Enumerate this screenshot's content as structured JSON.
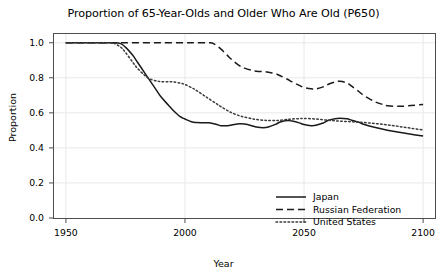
{
  "chart_data": {
    "type": "line",
    "title": "Proportion of 65-Year-Olds and Older Who Are Old (P650)",
    "xlabel": "Year",
    "ylabel": "Proportion",
    "xlim": [
      1945,
      2105
    ],
    "ylim": [
      0.0,
      1.05
    ],
    "xticks": [
      1950,
      2000,
      2050,
      2100
    ],
    "xtick_labels": [
      "1950",
      "2000",
      "2050",
      "2100"
    ],
    "yticks": [
      0.0,
      0.2,
      0.4,
      0.6,
      0.8,
      1.0
    ],
    "ytick_labels": [
      "0.0",
      "0.2",
      "0.4",
      "0.6",
      "0.8",
      "1.0"
    ],
    "grid": true,
    "legend_position": "lower right",
    "series": [
      {
        "name": "Japan",
        "style": "solid",
        "color": "#1a1a1a",
        "x": [
          1950,
          1955,
          1960,
          1965,
          1970,
          1973,
          1975,
          1978,
          1980,
          1983,
          1985,
          1988,
          1990,
          1993,
          1995,
          1998,
          2000,
          2003,
          2005,
          2008,
          2010,
          2013,
          2015,
          2018,
          2020,
          2023,
          2025,
          2028,
          2030,
          2033,
          2035,
          2038,
          2040,
          2043,
          2045,
          2048,
          2050,
          2053,
          2055,
          2058,
          2060,
          2063,
          2065,
          2068,
          2070,
          2073,
          2075,
          2080,
          2085,
          2090,
          2095,
          2100
        ],
        "y": [
          1.0,
          1.0,
          1.0,
          1.0,
          1.0,
          0.995,
          0.975,
          0.93,
          0.89,
          0.83,
          0.79,
          0.73,
          0.69,
          0.645,
          0.615,
          0.578,
          0.565,
          0.548,
          0.545,
          0.543,
          0.543,
          0.535,
          0.527,
          0.527,
          0.532,
          0.538,
          0.536,
          0.527,
          0.519,
          0.515,
          0.519,
          0.534,
          0.548,
          0.556,
          0.553,
          0.543,
          0.533,
          0.527,
          0.529,
          0.542,
          0.556,
          0.566,
          0.569,
          0.566,
          0.558,
          0.546,
          0.535,
          0.516,
          0.501,
          0.489,
          0.478,
          0.468
        ]
      },
      {
        "name": "Russian Federation",
        "style": "dashed",
        "color": "#1a1a1a",
        "x": [
          1950,
          1960,
          1970,
          1980,
          1990,
          2000,
          2005,
          2010,
          2012,
          2015,
          2018,
          2020,
          2023,
          2025,
          2028,
          2030,
          2033,
          2035,
          2038,
          2040,
          2043,
          2045,
          2048,
          2050,
          2053,
          2055,
          2058,
          2060,
          2063,
          2065,
          2068,
          2070,
          2073,
          2075,
          2078,
          2080,
          2083,
          2085,
          2090,
          2095,
          2100
        ],
        "y": [
          1.0,
          1.0,
          1.0,
          1.0,
          1.0,
          1.0,
          1.0,
          1.0,
          0.995,
          0.965,
          0.925,
          0.9,
          0.868,
          0.855,
          0.843,
          0.838,
          0.835,
          0.832,
          0.824,
          0.812,
          0.792,
          0.777,
          0.757,
          0.745,
          0.737,
          0.737,
          0.748,
          0.762,
          0.776,
          0.78,
          0.771,
          0.752,
          0.722,
          0.7,
          0.676,
          0.662,
          0.648,
          0.641,
          0.637,
          0.642,
          0.648
        ]
      },
      {
        "name": "United States",
        "style": "dotted",
        "color": "#3a3a3a",
        "x": [
          1950,
          1960,
          1968,
          1970,
          1973,
          1975,
          1978,
          1980,
          1983,
          1985,
          1988,
          1990,
          1993,
          1995,
          1998,
          2000,
          2003,
          2005,
          2008,
          2010,
          2013,
          2015,
          2018,
          2020,
          2023,
          2025,
          2028,
          2030,
          2033,
          2035,
          2038,
          2040,
          2043,
          2045,
          2048,
          2050,
          2055,
          2060,
          2065,
          2070,
          2075,
          2080,
          2085,
          2090,
          2095,
          2100
        ],
        "y": [
          1.0,
          1.0,
          1.0,
          0.998,
          0.975,
          0.945,
          0.89,
          0.855,
          0.815,
          0.795,
          0.782,
          0.778,
          0.778,
          0.777,
          0.77,
          0.762,
          0.742,
          0.726,
          0.699,
          0.681,
          0.654,
          0.636,
          0.612,
          0.598,
          0.583,
          0.576,
          0.567,
          0.562,
          0.558,
          0.556,
          0.556,
          0.558,
          0.562,
          0.565,
          0.567,
          0.568,
          0.565,
          0.558,
          0.553,
          0.549,
          0.545,
          0.539,
          0.531,
          0.522,
          0.512,
          0.503
        ]
      }
    ]
  },
  "legend": {
    "items": [
      {
        "label": "Japan",
        "style": "solid"
      },
      {
        "label": "Russian Federation",
        "style": "dashed"
      },
      {
        "label": "United States",
        "style": "dotted"
      }
    ]
  },
  "colors": {
    "axis": "#4d4d4d",
    "grid": "#e8e8e8",
    "text": "#000000",
    "background": "#ffffff"
  }
}
